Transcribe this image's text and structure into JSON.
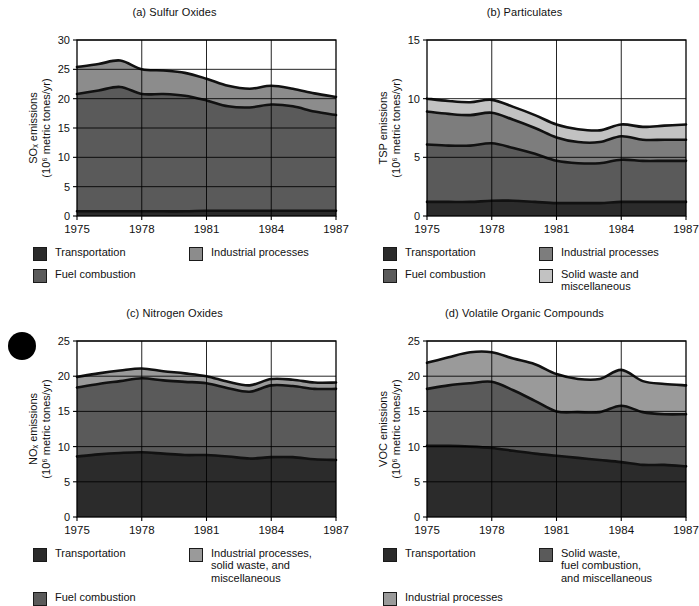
{
  "figure": {
    "panels": [
      {
        "id": "a",
        "title": "(a) Sulfur Oxides",
        "ylabel_line1": "SOₓ emissions",
        "ylabel_line2": "(10⁶ metric tones/yr)",
        "xlabel": "Year",
        "legend": [
          {
            "label": "Transportation",
            "color": "#2b2b2b"
          },
          {
            "label": "Industrial processes",
            "color": "#8c8c8c"
          },
          {
            "label": "Fuel combustion",
            "color": "#5a5a5a"
          }
        ]
      },
      {
        "id": "b",
        "title": "(b) Particulates",
        "ylabel_line1": "TSP emissions",
        "ylabel_line2": "(10⁶ metric tones/yr)",
        "xlabel": "Year",
        "legend": [
          {
            "label": "Transportation",
            "color": "#2b2b2b"
          },
          {
            "label": "Industrial processes",
            "color": "#7d7d7d"
          },
          {
            "label": "Fuel combustion",
            "color": "#5a5a5a"
          },
          {
            "label": "Solid waste and\nmiscellaneous",
            "color": "#c2c2c2"
          }
        ]
      },
      {
        "id": "c",
        "title": "(c) Nitrogen Oxides",
        "ylabel_line1": "NOₓ emissions",
        "ylabel_line2": "(10⁶ metric tones/yr)",
        "xlabel": "Year",
        "legend": [
          {
            "label": "Transportation",
            "color": "#2b2b2b"
          },
          {
            "label": "Industrial processes,\nsolid waste, and\nmiscellaneous",
            "color": "#9a9a9a"
          },
          {
            "label": "Fuel combustion",
            "color": "#5a5a5a"
          }
        ]
      },
      {
        "id": "d",
        "title": "(d) Volatile Organic Compounds",
        "ylabel_line1": "VOC emissions",
        "ylabel_line2": "(10⁶ metric tones/yr)",
        "xlabel": "Year",
        "legend": [
          {
            "label": "Transportation",
            "color": "#2b2b2b"
          },
          {
            "label": "Solid waste,\nfuel combustion,\nand miscellaneous",
            "color": "#5a5a5a"
          },
          {
            "label": "Industrial processes",
            "color": "#9a9a9a"
          }
        ]
      }
    ]
  },
  "chart_data": [
    {
      "type": "area",
      "panel": "a",
      "title": "(a) Sulfur Oxides",
      "xlabel": "Year",
      "ylabel": "SOₓ emissions (10⁶ metric tones/yr)",
      "ylim": [
        0,
        30
      ],
      "yticks": [
        0,
        5,
        10,
        15,
        20,
        25,
        30
      ],
      "xlim": [
        1975,
        1987
      ],
      "xticks": [
        1975,
        1978,
        1981,
        1984,
        1987
      ],
      "grid": true,
      "stacked": true,
      "x": [
        1975,
        1976,
        1977,
        1978,
        1979,
        1980,
        1981,
        1982,
        1983,
        1984,
        1985,
        1986,
        1987
      ],
      "series": [
        {
          "name": "Transportation",
          "color": "#2b2b2b",
          "values": [
            0.8,
            0.8,
            0.8,
            0.8,
            0.8,
            0.8,
            0.9,
            0.9,
            0.9,
            0.9,
            0.9,
            0.9,
            0.9
          ]
        },
        {
          "name": "Fuel combustion",
          "color": "#5a5a5a",
          "values": [
            20.0,
            20.6,
            21.2,
            20.0,
            20.0,
            19.7,
            18.8,
            17.8,
            17.6,
            18.1,
            17.8,
            16.9,
            16.3
          ]
        },
        {
          "name": "Industrial processes",
          "color": "#8c8c8c",
          "values": [
            4.6,
            4.5,
            4.5,
            4.2,
            4.0,
            3.9,
            3.7,
            3.5,
            3.2,
            3.2,
            3.0,
            3.1,
            3.1
          ]
        }
      ],
      "totals": [
        25.4,
        25.9,
        26.5,
        25.0,
        24.8,
        24.4,
        23.4,
        22.2,
        21.7,
        22.2,
        21.7,
        20.9,
        20.3
      ]
    },
    {
      "type": "area",
      "panel": "b",
      "title": "(b) Particulates",
      "xlabel": "Year",
      "ylabel": "TSP emissions (10⁶ metric tones/yr)",
      "ylim": [
        0,
        15
      ],
      "yticks": [
        0,
        5,
        10,
        15
      ],
      "xlim": [
        1975,
        1987
      ],
      "xticks": [
        1975,
        1978,
        1981,
        1984,
        1987
      ],
      "grid": true,
      "stacked": true,
      "x": [
        1975,
        1976,
        1977,
        1978,
        1979,
        1980,
        1981,
        1982,
        1983,
        1984,
        1985,
        1986,
        1987
      ],
      "series": [
        {
          "name": "Transportation",
          "color": "#2b2b2b",
          "values": [
            1.2,
            1.2,
            1.2,
            1.3,
            1.3,
            1.2,
            1.1,
            1.1,
            1.1,
            1.2,
            1.2,
            1.2,
            1.2
          ]
        },
        {
          "name": "Fuel combustion",
          "color": "#5a5a5a",
          "values": [
            4.9,
            4.8,
            4.8,
            4.9,
            4.5,
            4.1,
            3.6,
            3.4,
            3.4,
            3.6,
            3.5,
            3.5,
            3.5
          ]
        },
        {
          "name": "Industrial processes",
          "color": "#7d7d7d",
          "values": [
            2.8,
            2.7,
            2.6,
            2.6,
            2.4,
            2.2,
            2.0,
            1.8,
            1.8,
            2.0,
            1.8,
            1.8,
            1.8
          ]
        },
        {
          "name": "Solid waste and miscellaneous",
          "color": "#c2c2c2",
          "values": [
            1.1,
            1.1,
            1.1,
            1.1,
            1.1,
            1.1,
            1.1,
            1.1,
            1.0,
            1.0,
            1.1,
            1.2,
            1.3
          ]
        }
      ],
      "totals": [
        10.0,
        9.8,
        9.7,
        9.9,
        9.3,
        8.6,
        7.8,
        7.4,
        7.3,
        7.8,
        7.6,
        7.7,
        7.8
      ]
    },
    {
      "type": "area",
      "panel": "c",
      "title": "(c) Nitrogen Oxides",
      "xlabel": "Year",
      "ylabel": "NOₓ emissions (10⁶ metric tones/yr)",
      "ylim": [
        0,
        25
      ],
      "yticks": [
        0,
        5,
        10,
        15,
        20,
        25
      ],
      "xlim": [
        1975,
        1987
      ],
      "xticks": [
        1975,
        1978,
        1981,
        1984,
        1987
      ],
      "grid": true,
      "stacked": true,
      "x": [
        1975,
        1976,
        1977,
        1978,
        1979,
        1980,
        1981,
        1982,
        1983,
        1984,
        1985,
        1986,
        1987
      ],
      "series": [
        {
          "name": "Transportation",
          "color": "#2b2b2b",
          "values": [
            8.6,
            8.9,
            9.1,
            9.2,
            9.0,
            8.8,
            8.8,
            8.6,
            8.3,
            8.5,
            8.5,
            8.2,
            8.1
          ]
        },
        {
          "name": "Fuel combustion",
          "color": "#5a5a5a",
          "values": [
            9.8,
            10.0,
            10.2,
            10.5,
            10.4,
            10.4,
            10.2,
            9.7,
            9.5,
            10.2,
            10.1,
            10.0,
            10.1
          ]
        },
        {
          "name": "Industrial processes, solid waste, and miscellaneous",
          "color": "#9a9a9a",
          "values": [
            1.5,
            1.5,
            1.5,
            1.4,
            1.3,
            1.2,
            1.0,
            0.9,
            0.9,
            0.9,
            0.9,
            0.9,
            0.9
          ]
        }
      ],
      "totals": [
        19.9,
        20.4,
        20.8,
        21.1,
        20.7,
        20.4,
        20.0,
        19.2,
        18.7,
        19.6,
        19.5,
        19.1,
        19.1
      ]
    },
    {
      "type": "area",
      "panel": "d",
      "title": "(d) Volatile Organic Compounds",
      "xlabel": "Year",
      "ylabel": "VOC emissions (10⁶ metric tones/yr)",
      "ylim": [
        0,
        25
      ],
      "yticks": [
        0,
        5,
        10,
        15,
        20,
        25
      ],
      "xlim": [
        1975,
        1987
      ],
      "xticks": [
        1975,
        1978,
        1981,
        1984,
        1987
      ],
      "grid": true,
      "stacked": true,
      "x": [
        1975,
        1976,
        1977,
        1978,
        1979,
        1980,
        1981,
        1982,
        1983,
        1984,
        1985,
        1986,
        1987
      ],
      "series": [
        {
          "name": "Transportation",
          "color": "#2b2b2b",
          "values": [
            10.1,
            10.1,
            10.0,
            9.8,
            9.4,
            9.0,
            8.7,
            8.4,
            8.1,
            7.8,
            7.4,
            7.4,
            7.2
          ]
        },
        {
          "name": "Solid waste, fuel combustion, and miscellaneous",
          "color": "#5a5a5a",
          "values": [
            8.1,
            8.6,
            9.0,
            9.4,
            8.6,
            7.5,
            6.3,
            6.5,
            6.8,
            8.0,
            7.5,
            7.2,
            7.4
          ]
        },
        {
          "name": "Industrial processes",
          "color": "#9a9a9a",
          "values": [
            3.7,
            4.0,
            4.4,
            4.2,
            4.5,
            5.2,
            5.3,
            4.7,
            4.7,
            5.1,
            4.4,
            4.3,
            4.1
          ]
        }
      ],
      "totals": [
        21.9,
        22.7,
        23.4,
        23.4,
        22.5,
        21.7,
        20.3,
        19.6,
        19.6,
        20.9,
        19.3,
        18.9,
        18.7
      ]
    }
  ]
}
